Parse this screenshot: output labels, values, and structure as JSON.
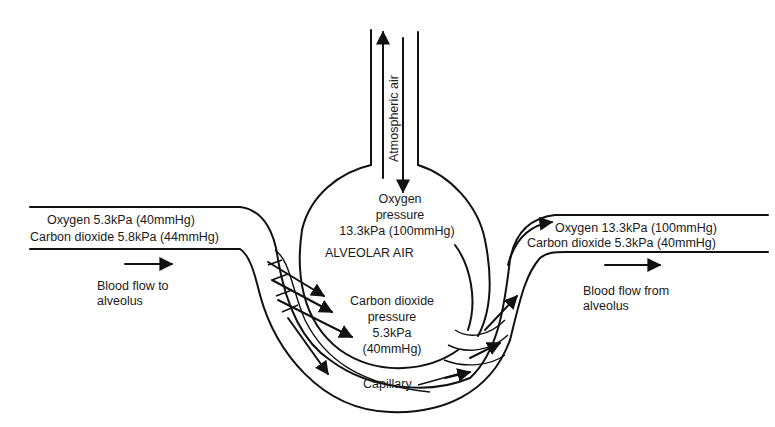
{
  "diagram": {
    "trachea": {
      "label": "Atmospheric air"
    },
    "alveolus": {
      "oxygen_line1": "Oxygen",
      "oxygen_line2": "pressure",
      "oxygen_line3": "13.3kPa (100mmHg)",
      "name": "ALVEOLAR AIR",
      "co2_line1": "Carbon dioxide",
      "co2_line2": "pressure",
      "co2_line3": "5.3kPa",
      "co2_line4": "(40mmHg)"
    },
    "inflow": {
      "oxygen": "Oxygen 5.3kPa (40mmHg)",
      "co2": "Carbon dioxide 5.8kPa (44mmHg)",
      "flow_line1": "Blood flow to",
      "flow_line2": "alveolus"
    },
    "outflow": {
      "oxygen": "Oxygen 13.3kPa (100mmHg)",
      "co2": "Carbon dioxide 5.3kPa (40mmHg)",
      "flow_line1": "Blood flow from",
      "flow_line2": "alveolus"
    },
    "capillary_label": "Capillary"
  }
}
